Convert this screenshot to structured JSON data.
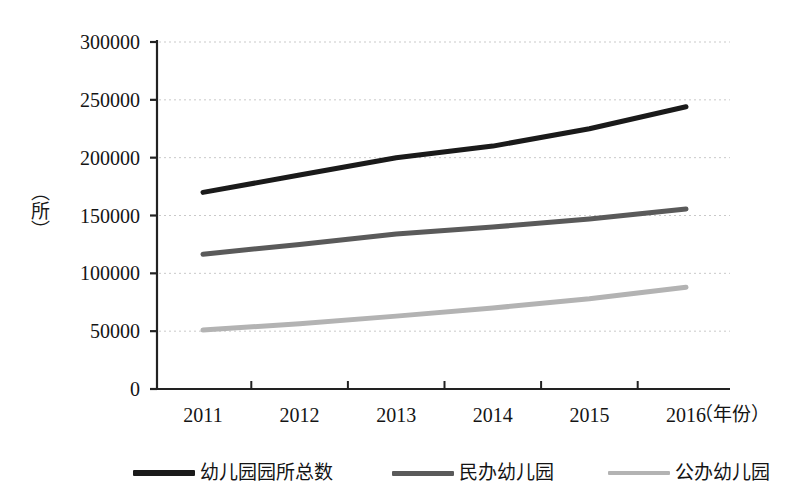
{
  "chart_data": {
    "type": "line",
    "title": "",
    "xlabel": "（年份）",
    "ylabel": "（所）",
    "categories": [
      "2011",
      "2012",
      "2013",
      "2014",
      "2015",
      "2016"
    ],
    "ylim": [
      0,
      300000
    ],
    "y_ticks": [
      "0",
      "50000",
      "100000",
      "150000",
      "200000",
      "250000",
      "300000"
    ],
    "y_tick_values": [
      0,
      50000,
      100000,
      150000,
      200000,
      250000,
      300000
    ],
    "grid": true,
    "grid_style": "dotted-horizontal",
    "legend_position": "bottom",
    "series": [
      {
        "name": "幼儿园园所总数",
        "color": "#1a1a1a",
        "width": 5,
        "values": [
          170000,
          185000,
          200000,
          210000,
          225000,
          244000
        ]
      },
      {
        "name": "民办幼儿园",
        "color": "#5a5a5a",
        "width": 5,
        "values": [
          116500,
          125000,
          134000,
          140000,
          147000,
          155600
        ]
      },
      {
        "name": "公办幼儿园",
        "color": "#b3b3b3",
        "width": 5,
        "values": [
          51000,
          56500,
          63000,
          70000,
          78000,
          88000
        ]
      }
    ]
  },
  "axes": {
    "y_unit_label": "（所）",
    "x_unit_label": "（年份）"
  },
  "legend": {
    "items": [
      {
        "label": "幼儿园园所总数",
        "color": "#1a1a1a"
      },
      {
        "label": "民办幼儿园",
        "color": "#5a5a5a"
      },
      {
        "label": "公办幼儿园",
        "color": "#b3b3b3"
      }
    ]
  }
}
